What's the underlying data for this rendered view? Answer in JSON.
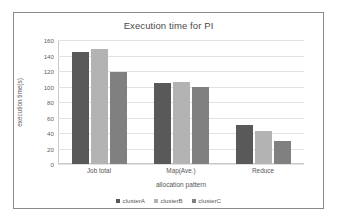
{
  "chart_data": {
    "type": "bar",
    "title": "Execution time for PI",
    "xlabel": "allocation pattern",
    "ylabel": "execution time(s)",
    "categories": [
      "Job total",
      "Map(Ave.)",
      "Reduce"
    ],
    "series": [
      {
        "name": "clusterA",
        "color": "#595959",
        "values": [
          144,
          105,
          50
        ]
      },
      {
        "name": "clusterB",
        "color": "#b3b3b3",
        "values": [
          148,
          106,
          43
        ]
      },
      {
        "name": "clusterC",
        "color": "#808080",
        "values": [
          119,
          99,
          30
        ]
      }
    ],
    "ylim": [
      0,
      160
    ],
    "yticks": [
      0,
      20,
      40,
      60,
      80,
      100,
      120,
      140,
      160
    ],
    "grid": true,
    "legend_position": "bottom"
  },
  "frame": {
    "border_color": "#888b8d",
    "background": "#ffffff"
  }
}
